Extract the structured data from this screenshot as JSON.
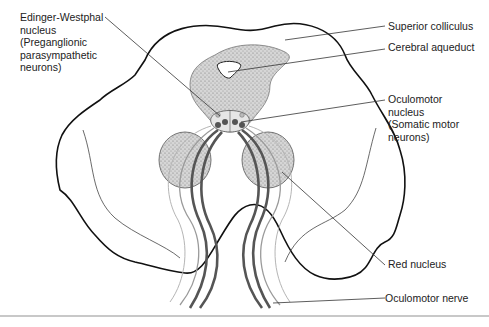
{
  "diagram": {
    "colors": {
      "outline": "#111111",
      "stipple_fill": "#cfcfcf",
      "nerve_dark": "#555555",
      "nerve_light": "#9a9a9a",
      "leader_line": "#333333",
      "bottom_rule": "#c8c8c8"
    },
    "labels": {
      "edinger_westphal": {
        "line1": "Edinger-Westphal",
        "line2": "nucleus",
        "line3": "(Preganglionic",
        "line4": "parasympathetic",
        "line5": "neurons)"
      },
      "superior_colliculus": "Superior colliculus",
      "cerebral_aqueduct": "Cerebral aqueduct",
      "oculomotor_nucleus": {
        "line1": "Oculomotor",
        "line2": "nucleus",
        "line3": "(Somatic motor",
        "line4": "neurons)"
      },
      "red_nucleus": "Red nucleus",
      "oculomotor_nerve": "Oculomotor nerve"
    }
  }
}
